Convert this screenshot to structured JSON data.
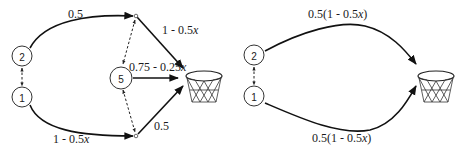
{
  "left_diagram": {
    "nodes": [
      {
        "id": "2",
        "label": "2"
      },
      {
        "id": "1",
        "label": "1"
      },
      {
        "id": "5",
        "label": "5"
      }
    ],
    "edges": {
      "node2_to_top": "0.5",
      "top_to_basket": {
        "prefix": "1 - 0.5",
        "var": "x"
      },
      "node5_to_basket": {
        "prefix": "0.75 - 0.25",
        "var": "x"
      },
      "node1_to_bottom": {
        "prefix": "1 - 0.5",
        "var": "x"
      },
      "bottom_to_basket": "0.5"
    },
    "target": "basket-icon"
  },
  "right_diagram": {
    "nodes": [
      {
        "id": "2",
        "label": "2"
      },
      {
        "id": "1",
        "label": "1"
      }
    ],
    "edges": {
      "node2_to_basket": {
        "prefix": "0.5(1 - 0.5",
        "var": "x",
        "suffix": ")"
      },
      "node1_to_basket": {
        "prefix": "0.5(1 - 0.5",
        "var": "x",
        "suffix": ")"
      }
    },
    "target": "basket-icon"
  },
  "colors": {
    "stroke": "#111111",
    "background": "#ffffff"
  }
}
